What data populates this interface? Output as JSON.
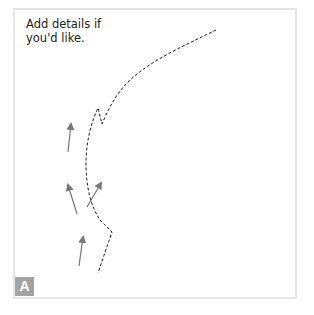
{
  "canvas": {
    "note": "Add details if you'd like.",
    "note_lines": [
      "Add details if",
      "you'd like."
    ],
    "badge_label": "A",
    "colors": {
      "frame_border": "#e6e6e6",
      "badge_bg": "#a3a3a3",
      "arrow": "#777777",
      "path": "#222222"
    }
  },
  "drawing": {
    "dashed_path_points": [
      [
        216,
        30
      ],
      [
        190,
        43
      ],
      [
        160,
        58
      ],
      [
        133,
        77
      ],
      [
        118,
        92
      ],
      [
        110,
        105
      ],
      [
        104,
        120
      ],
      [
        102,
        124
      ],
      [
        98,
        108
      ],
      [
        92,
        122
      ],
      [
        88,
        140
      ],
      [
        86,
        163
      ],
      [
        87,
        185
      ],
      [
        92,
        207
      ],
      [
        100,
        220
      ],
      [
        112,
        232
      ],
      [
        98,
        273
      ]
    ],
    "arrows": [
      {
        "from": [
          87,
          207
        ],
        "to": [
          102,
          182
        ]
      },
      {
        "from": [
          68,
          152
        ],
        "to": [
          71,
          123
        ]
      },
      {
        "from": [
          77,
          214
        ],
        "to": [
          68,
          184
        ]
      },
      {
        "from": [
          79,
          266
        ],
        "to": [
          83,
          236
        ]
      }
    ]
  }
}
